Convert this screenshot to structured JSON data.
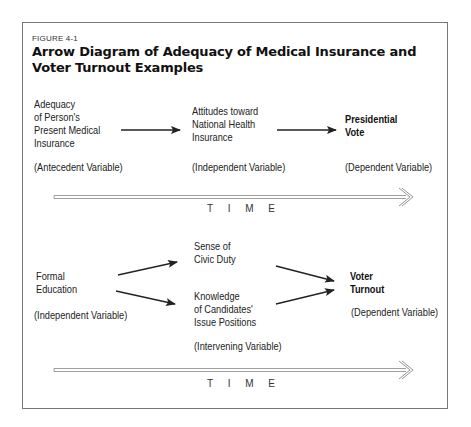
{
  "figure": {
    "label": "FIGURE 4-1",
    "title": "Arrow Diagram of Adequacy of Medical Insurance and Voter Turnout Examples"
  },
  "diagram1": {
    "nodes": [
      {
        "id": "adequacy",
        "lines": [
          "Adequacy",
          "of Person's",
          "Present Medical",
          "Insurance"
        ],
        "role": "(Antecedent Variable)",
        "bold": false
      },
      {
        "id": "attitudes",
        "lines": [
          "Attitudes toward",
          "National Health",
          "Insurance"
        ],
        "role": "(Independent Variable)",
        "bold": false
      },
      {
        "id": "presidential-vote",
        "lines": [
          "Presidential",
          "Vote"
        ],
        "role": "(Dependent Variable)",
        "bold": true
      }
    ],
    "edges": [
      {
        "from": "adequacy",
        "to": "attitudes"
      },
      {
        "from": "attitudes",
        "to": "presidential-vote"
      }
    ],
    "time_label": "T I M E"
  },
  "diagram2": {
    "nodes": [
      {
        "id": "formal-education",
        "lines": [
          "Formal",
          "Education"
        ],
        "role": "(Independent Variable)",
        "bold": false
      },
      {
        "id": "civic-duty",
        "lines": [
          "Sense of",
          "Civic Duty"
        ],
        "role": "",
        "bold": false
      },
      {
        "id": "knowledge",
        "lines": [
          "Knowledge",
          "of Candidates'",
          "Issue Positions"
        ],
        "role": "(Intervening Variable)",
        "bold": false
      },
      {
        "id": "voter-turnout",
        "lines": [
          "Voter",
          "Turnout"
        ],
        "role": "(Dependent Variable)",
        "bold": true
      }
    ],
    "edges": [
      {
        "from": "formal-education",
        "to": "civic-duty"
      },
      {
        "from": "formal-education",
        "to": "knowledge"
      },
      {
        "from": "civic-duty",
        "to": "voter-turnout"
      },
      {
        "from": "knowledge",
        "to": "voter-turnout"
      }
    ],
    "time_label": "T I M E"
  }
}
